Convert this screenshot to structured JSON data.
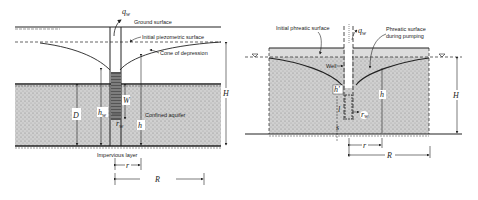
{
  "left_diagram": {
    "title": "Confined aquifer well",
    "labels": {
      "qw": "q",
      "qw_sub": "w",
      "ground_surface": "Ground surface",
      "initial_piezometric": "Initial piezometric surface",
      "cone": "Cone of depression",
      "confined_aquifer": "Confined aquifer",
      "impervious": "Impervious layer",
      "D": "D",
      "hw": "h",
      "hw_sub": "w",
      "W": "W",
      "rw": "r",
      "rw_sub": "w",
      "h": "h",
      "H": "H",
      "r": "r",
      "R": "R"
    }
  },
  "right_diagram": {
    "title": "Unconfined aquifer well",
    "labels": {
      "initial_phreatic": "Initial phreatic surface",
      "qw": "q",
      "qw_sub": "w",
      "phreatic_pumping_1": "Phreatic surface",
      "phreatic_pumping_2": "during pumping",
      "well": "Well",
      "hprime": "h'",
      "h": "h",
      "H": "H",
      "l": "l",
      "s": "s",
      "rw": "r",
      "rw_sub": "w",
      "r": "r",
      "R": "R"
    }
  },
  "colors": {
    "line": "#222222",
    "soil": "#c9c9c9",
    "background": "#ffffff"
  }
}
